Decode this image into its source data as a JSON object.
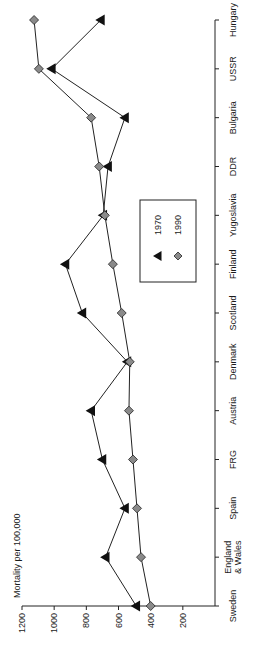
{
  "chart_data": {
    "type": "line",
    "orientation": "rotated-90",
    "title": "",
    "ylabel": "Mortality per 100,000",
    "xlabel": "",
    "ylim": [
      0,
      1200
    ],
    "yticks": [
      200,
      400,
      600,
      800,
      1000,
      1200
    ],
    "categories": [
      "Sweden",
      "England & Wales",
      "Spain",
      "FRG",
      "Austria",
      "Denmark",
      "Scotland",
      "Finland",
      "Yugoslavia",
      "DDR",
      "Bulgaria",
      "USSR",
      "Hungary"
    ],
    "category_label_lines": [
      [
        "Sweden"
      ],
      [
        "England",
        "& Wales"
      ],
      [
        "Spain"
      ],
      [
        "FRG"
      ],
      [
        "Austria"
      ],
      [
        "Denmark"
      ],
      [
        "Scotland"
      ],
      [
        "Finland"
      ],
      [
        "Yugoslavia"
      ],
      [
        "DDR"
      ],
      [
        "Bulgaria"
      ],
      [
        "USSR"
      ],
      [
        "Hungary"
      ]
    ],
    "series": [
      {
        "name": "1970",
        "marker": "triangle",
        "color": "#111111",
        "values": [
          490,
          680,
          560,
          700,
          770,
          545,
          825,
          930,
          695,
          665,
          560,
          1015,
          710
        ]
      },
      {
        "name": "1990",
        "marker": "diamond",
        "color": "#888888",
        "values": [
          400,
          460,
          485,
          510,
          535,
          530,
          580,
          635,
          685,
          720,
          770,
          1095,
          1125
        ]
      }
    ],
    "legend": {
      "position": "inside-center",
      "entries": [
        "1970",
        "1990"
      ]
    },
    "grid": false
  }
}
